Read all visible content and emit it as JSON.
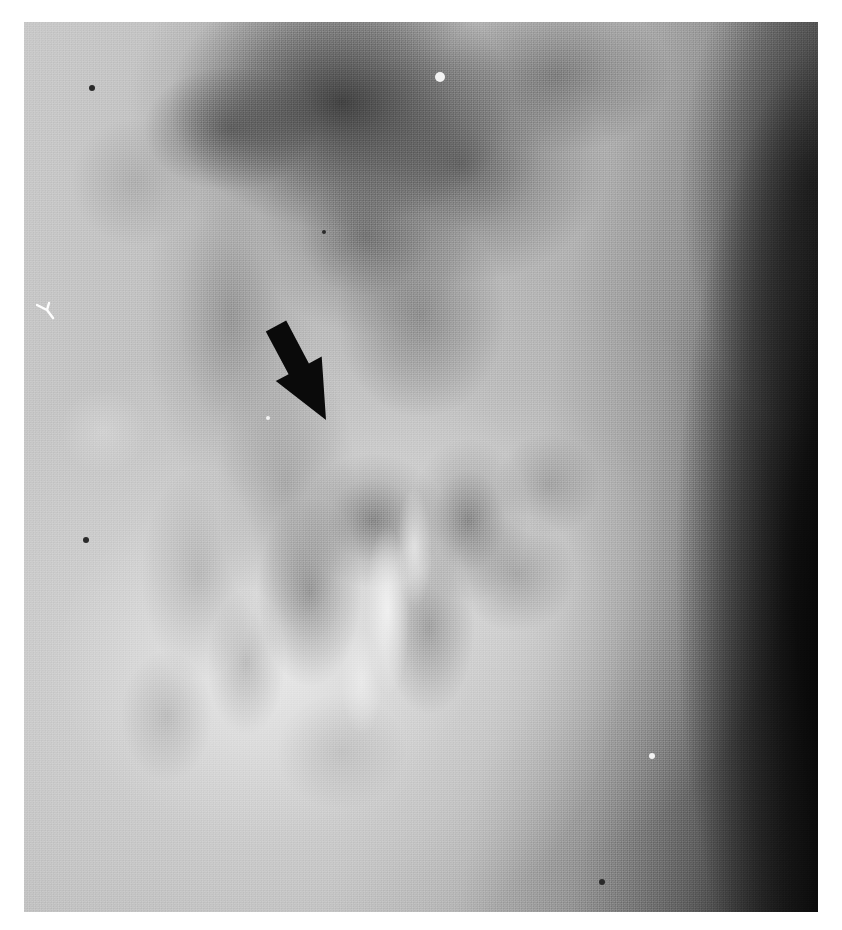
{
  "image": {
    "kind": "radiograph",
    "modality_label": "plain-film radiograph",
    "caption": "",
    "background_color": "#ffffff",
    "plate": {
      "left": 24,
      "top": 22,
      "width": 794,
      "height": 890,
      "tone_min": "#101010",
      "tone_max": "#ededed",
      "base_tone": "#bdbdbd"
    }
  },
  "annotations": {
    "arrow": {
      "name": "pointer-arrow",
      "color": "#0a0a0a",
      "tail_x": 252,
      "tail_y": 304,
      "tip_x": 302,
      "tip_y": 398,
      "shaft_width": 23,
      "head_length": 58,
      "head_width": 52,
      "direction": "down-right"
    },
    "specks": [
      {
        "name": "bright-speck-upper",
        "x": 416,
        "y": 55,
        "r": 5,
        "tone": "bright"
      },
      {
        "name": "bright-speck-mid",
        "x": 244,
        "y": 396,
        "r": 2,
        "tone": "bright"
      },
      {
        "name": "bright-speck-lower",
        "x": 628,
        "y": 734,
        "r": 3,
        "tone": "bright"
      },
      {
        "name": "dark-speck-upper-left",
        "x": 68,
        "y": 66,
        "r": 3,
        "tone": "dark"
      },
      {
        "name": "dark-speck-left",
        "x": 62,
        "y": 518,
        "r": 3,
        "tone": "dark"
      },
      {
        "name": "dark-speck-center",
        "x": 300,
        "y": 210,
        "r": 2,
        "tone": "dark"
      },
      {
        "name": "dark-speck-lower",
        "x": 578,
        "y": 860,
        "r": 3,
        "tone": "dark"
      }
    ],
    "film_artifact": {
      "name": "white-y-scratch",
      "x": 12,
      "y": 278,
      "color": "#fdfdfd"
    }
  },
  "regions": [
    {
      "name": "upper-central-opacity",
      "description": "dark soft-tissue/gas mass upper centre"
    },
    {
      "name": "right-lateral-dark-band",
      "description": "dense black band along right margin widening inferiorly"
    },
    {
      "name": "lower-central-bowel-loops",
      "description": "overlapping mid-grey loops below arrow tip"
    },
    {
      "name": "contrast-filled-lumen",
      "description": "bright curved band running inferolaterally"
    },
    {
      "name": "left-lateral-lucency",
      "description": "bright field occupying lower-left quadrant"
    }
  ]
}
